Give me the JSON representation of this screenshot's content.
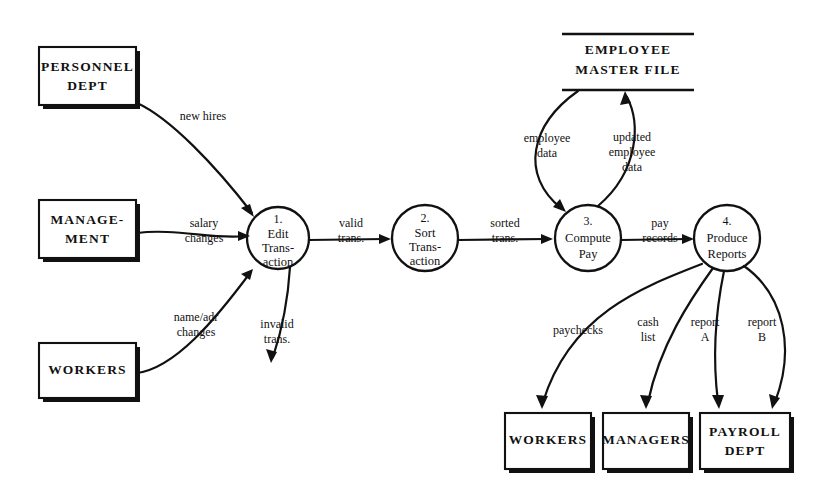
{
  "diagram": {
    "type": "data-flow-diagram",
    "notation": "Yourdon/DeMarco",
    "background_color": "#ffffff",
    "ink_color": "#111111"
  },
  "external_entities": [
    {
      "id": "personnel-dept",
      "lines": [
        "PERSONNEL",
        "DEPT"
      ],
      "x": 39,
      "y": 47,
      "w": 97,
      "h": 58
    },
    {
      "id": "management",
      "lines": [
        "MANAGE-",
        "MENT"
      ],
      "x": 39,
      "y": 200,
      "w": 97,
      "h": 58
    },
    {
      "id": "workers-source",
      "lines": [
        "WORKERS"
      ],
      "x": 39,
      "y": 343,
      "w": 97,
      "h": 55
    },
    {
      "id": "workers-sink",
      "lines": [
        "WORKERS"
      ],
      "x": 505,
      "y": 413,
      "w": 86,
      "h": 56
    },
    {
      "id": "managers-sink",
      "lines": [
        "MANAGERS"
      ],
      "x": 603,
      "y": 413,
      "w": 86,
      "h": 56
    },
    {
      "id": "payroll-dept-sink",
      "lines": [
        "PAYROLL",
        "DEPT"
      ],
      "x": 700,
      "y": 413,
      "w": 90,
      "h": 56
    }
  ],
  "data_stores": [
    {
      "id": "employee-master-file",
      "lines": [
        "EMPLOYEE",
        "MASTER FILE"
      ],
      "x": 562,
      "y": 34,
      "w": 132,
      "h": 56
    }
  ],
  "processes": [
    {
      "id": "edit-transaction",
      "number": "1.",
      "lines": [
        "Edit",
        "Trans-",
        "action"
      ],
      "cx": 278,
      "cy": 238,
      "r": 31
    },
    {
      "id": "sort-transaction",
      "number": "2.",
      "lines": [
        "Sort",
        "Trans-",
        "action"
      ],
      "cx": 425,
      "cy": 238,
      "r": 33
    },
    {
      "id": "compute-pay",
      "number": "3.",
      "lines": [
        "Compute",
        "Pay"
      ],
      "cx": 588,
      "cy": 238,
      "r": 33
    },
    {
      "id": "produce-reports",
      "number": "4.",
      "lines": [
        "Produce",
        "Reports"
      ],
      "cx": 727,
      "cy": 238,
      "r": 33
    }
  ],
  "data_flows": [
    {
      "id": "new-hires",
      "lines": [
        "new hires"
      ],
      "from": "personnel-dept",
      "to": "edit-transaction",
      "label_x": 203,
      "label_y": 117
    },
    {
      "id": "salary-changes",
      "lines": [
        "salary",
        "changes"
      ],
      "from": "management",
      "to": "edit-transaction",
      "label_x": 204,
      "label_y": 231
    },
    {
      "id": "name-adr-changes",
      "lines": [
        "name/adr",
        "changes"
      ],
      "from": "workers-source",
      "to": "edit-transaction",
      "label_x": 196,
      "label_y": 325
    },
    {
      "id": "invalid-trans",
      "lines": [
        "invalid",
        "trans."
      ],
      "from": "edit-transaction",
      "to": null,
      "label_x": 277,
      "label_y": 332
    },
    {
      "id": "valid-trans",
      "lines": [
        "valid",
        "trans."
      ],
      "from": "edit-transaction",
      "to": "sort-transaction",
      "label_x": 351,
      "label_y": 231
    },
    {
      "id": "sorted-trans",
      "lines": [
        "sorted",
        "trans."
      ],
      "from": "sort-transaction",
      "to": "compute-pay",
      "label_x": 505,
      "label_y": 231
    },
    {
      "id": "employee-data",
      "lines": [
        "employee",
        "data"
      ],
      "from": "employee-master-file",
      "to": "compute-pay",
      "label_x": 547,
      "label_y": 146
    },
    {
      "id": "updated-employee-data",
      "lines": [
        "updated",
        "employee",
        "data"
      ],
      "from": "compute-pay",
      "to": "employee-master-file",
      "label_x": 632,
      "label_y": 152
    },
    {
      "id": "pay-records",
      "lines": [
        "pay",
        "records"
      ],
      "from": "compute-pay",
      "to": "produce-reports",
      "label_x": 660,
      "label_y": 231
    },
    {
      "id": "paychecks",
      "lines": [
        "paychecks"
      ],
      "from": "produce-reports",
      "to": "workers-sink",
      "label_x": 578,
      "label_y": 330
    },
    {
      "id": "cash-list",
      "lines": [
        "cash",
        "list"
      ],
      "from": "produce-reports",
      "to": "managers-sink",
      "label_x": 648,
      "label_y": 330
    },
    {
      "id": "report-a",
      "lines": [
        "report",
        "A"
      ],
      "from": "produce-reports",
      "to": "payroll-dept-sink",
      "label_x": 705,
      "label_y": 330
    },
    {
      "id": "report-b",
      "lines": [
        "report",
        "B"
      ],
      "from": "produce-reports",
      "to": "payroll-dept-sink",
      "label_x": 762,
      "label_y": 330
    }
  ]
}
